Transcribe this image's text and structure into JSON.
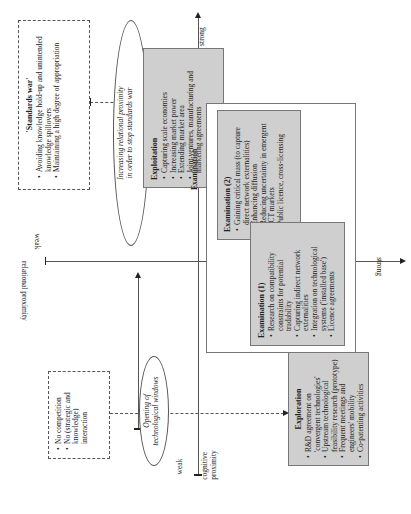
{
  "axes": {
    "cognitive": {
      "label": "cognitive proximity",
      "label_line1": "cognitive",
      "label_line2": "proximity",
      "weak": "weak",
      "strong": "strong"
    },
    "relational": {
      "label": "relational proximity",
      "weak": "weak",
      "strong": "strong"
    }
  },
  "standards_war": {
    "title": "'Standards war'",
    "items": [
      "Avoiding knowledge hold-up and unintended knowledge spillovers",
      "Maintaining a high degree of appropriation"
    ]
  },
  "oval_relational": {
    "line1": "Increasing relational proximity",
    "line2": "in order to stop standards war"
  },
  "exploitation": {
    "title": "Exploitation",
    "items": [
      "Capturing scale economies",
      "Increasing market power",
      "Extending market area",
      "Joint ventures, manufacturing and marketing agreements"
    ]
  },
  "examination": {
    "label": "Examination",
    "exam2": {
      "title": "Examination (2)",
      "items": [
        "Gaining critical mass (to capture direct network externalities)",
        "Enhancing diffusion",
        "Reducing uncertainty in emergent ICT markets",
        "Public licence, cross-licensing"
      ],
      "underlined": "diffusion"
    },
    "exam1": {
      "title": "Examination (1)",
      "items": [
        "Research on compatibility constraints for potential tradability",
        "Capturing indirect network externalities",
        "Integration on technological systems ('installed base')",
        "Licence agreements"
      ],
      "underlined": "potential tradability"
    }
  },
  "exploration": {
    "title": "Exploration",
    "items": [
      "R&D agreement on 'convergent technologies'",
      "Upstream technological feasibility research (prototype)",
      "Frequent meetings and engineers' mobility",
      "Co-patenting activities"
    ]
  },
  "no_competition": {
    "items": [
      "No competition",
      "No (strategic and knowledge) interaction"
    ]
  },
  "oval_windows": {
    "line1": "Opening of",
    "line2": "technological windows"
  }
}
